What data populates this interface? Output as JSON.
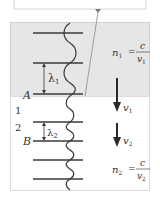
{
  "diagram": {
    "colors": {
      "medium1_fill": "#e6e6e6",
      "medium2_fill": "#ffffff",
      "border": "#cfcfcf",
      "wavefront": "#3a3a3a",
      "arrow": "#2a2a2a",
      "text": "#333333"
    },
    "media": [
      {
        "id": "1",
        "label": "1",
        "index_eq": {
          "lhs": "n",
          "lhs_sub": "1",
          "num": "c",
          "den": "v",
          "den_sub": "1"
        },
        "speed_label": "v",
        "speed_sub": "1",
        "wavelength_label": "λ",
        "wavelength_sub": "1",
        "point_label": "A"
      },
      {
        "id": "2",
        "label": "2",
        "index_eq": {
          "lhs": "n",
          "lhs_sub": "2",
          "num": "c",
          "den": "v",
          "den_sub": "2"
        },
        "speed_label": "v",
        "speed_sub": "2",
        "wavelength_label": "λ",
        "wavelength_sub": "2",
        "point_label": "B"
      }
    ],
    "equals": "="
  }
}
